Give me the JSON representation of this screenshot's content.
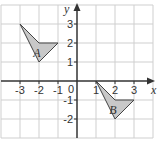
{
  "diagram": {
    "type": "coordinate-grid",
    "grid": {
      "x_min": -4,
      "x_max": 4,
      "y_min": -3,
      "y_max": 4,
      "cell_px": 19,
      "origin_px": [
        77,
        81
      ],
      "grid_color": "#cfcfcf",
      "axis_color": "#333333"
    },
    "axes": {
      "x_label": "x",
      "y_label": "y",
      "x_ticks": [
        {
          "value": -3,
          "label": "-3"
        },
        {
          "value": -2,
          "label": "-2"
        },
        {
          "value": -1,
          "label": "-1"
        },
        {
          "value": 1,
          "label": "1"
        },
        {
          "value": 2,
          "label": "2"
        },
        {
          "value": 3,
          "label": "3"
        }
      ],
      "y_ticks": [
        {
          "value": 3,
          "label": "3"
        },
        {
          "value": 2,
          "label": "2"
        },
        {
          "value": 1,
          "label": "1"
        },
        {
          "value": -1,
          "label": "-1"
        },
        {
          "value": -2,
          "label": "-2"
        }
      ],
      "origin_label": "0"
    },
    "shapes": [
      {
        "name": "A",
        "label": "A",
        "vertices": [
          [
            -3,
            3
          ],
          [
            -2,
            2
          ],
          [
            -1,
            2
          ],
          [
            -2,
            1
          ]
        ],
        "label_pos": [
          -2.3,
          1.5
        ],
        "fill": "#c8c8c8",
        "stroke": "#444444"
      },
      {
        "name": "B",
        "label": "B",
        "vertices": [
          [
            1,
            0
          ],
          [
            2,
            -1
          ],
          [
            3,
            -1
          ],
          [
            2,
            -2
          ]
        ],
        "label_pos": [
          1.7,
          -1.5
        ],
        "fill": "#c8c8c8",
        "stroke": "#444444"
      }
    ]
  }
}
